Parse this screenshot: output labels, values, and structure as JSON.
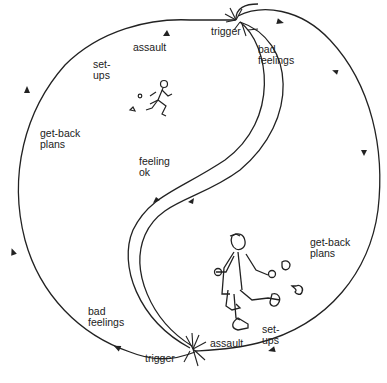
{
  "diagram": {
    "type": "cycle-diagram",
    "colors": {
      "line": "#222222",
      "background": "#ffffff"
    },
    "top_cycle": {
      "labels": {
        "trigger": "trigger",
        "bad_feelings_line1": "bad",
        "bad_feelings_line2": "feelings",
        "assault": "assault",
        "setups_line1": "set-",
        "setups_line2": "ups",
        "getback_line1": "get-back",
        "getback_line2": "plans"
      }
    },
    "center": {
      "feeling_ok_line1": "feeling",
      "feeling_ok_line2": "ok"
    },
    "bottom_cycle": {
      "labels": {
        "getback_line1": "get-back",
        "getback_line2": "plans",
        "setups_line1": "set-",
        "setups_line2": "ups",
        "assault": "assault",
        "trigger": "trigger",
        "bad_feelings_line1": "bad",
        "bad_feelings_line2": "feelings"
      }
    },
    "figures": [
      {
        "name": "small-running-man",
        "position": "upper-left of center"
      },
      {
        "name": "large-running-man",
        "position": "lower-right of center"
      }
    ]
  }
}
